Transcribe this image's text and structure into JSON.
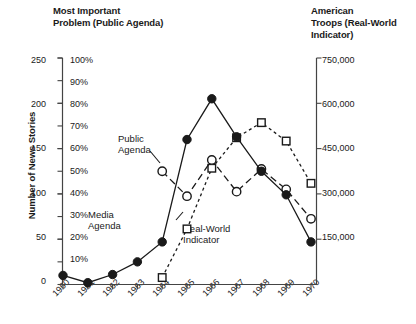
{
  "titles": {
    "left_line1": "Most Important",
    "left_line2": "Problem (Public Agenda)",
    "right_line1": "American",
    "right_line2": "Troops (Real-World",
    "right_line3": "Indicator)"
  },
  "axis": {
    "y_left_title": "Number of News Stories",
    "y_left_num_ticks": [
      "250",
      "200",
      "150",
      "100",
      "50",
      "0"
    ],
    "y_left_pct_ticks": [
      "100%",
      "90%",
      "80%",
      "70%",
      "60%",
      "50%",
      "40%",
      "30%",
      "20%",
      "10%"
    ],
    "y_right_ticks": [
      "750,000",
      "600,000",
      "450,000",
      "300,000",
      "150,000"
    ],
    "x_ticks": [
      "1960",
      "1961",
      "1962",
      "1963",
      "1964",
      "1965",
      "1966",
      "1967",
      "1968",
      "1969",
      "1970"
    ]
  },
  "annotations": {
    "public_line1": "Public",
    "public_line2": "Agenda",
    "media_line1": "Media",
    "media_line2": "Agenda",
    "real_line1": "Real-World",
    "real_line2": "Indicator"
  },
  "colors": {
    "ink": "#1a1a1a",
    "axis": "#444444",
    "background": "#ffffff"
  },
  "chart_data": {
    "type": "line",
    "xlabel": "",
    "ylabel": "Number of News Stories",
    "x": [
      1960,
      1961,
      1962,
      1963,
      1964,
      1965,
      1966,
      1967,
      1968,
      1969,
      1970
    ],
    "grid": false,
    "legend": "inline-annotations",
    "axes": [
      {
        "id": "left-stories",
        "label": "Number of News Stories",
        "ticks": [
          0,
          50,
          100,
          150,
          200,
          250
        ],
        "ylim": [
          0,
          250
        ]
      },
      {
        "id": "left-percent",
        "label": "Most Important Problem (Public Agenda)",
        "ticks": [
          10,
          20,
          30,
          40,
          50,
          60,
          70,
          80,
          90,
          100
        ],
        "ylim": [
          0,
          100
        ],
        "unit": "%"
      },
      {
        "id": "right-troops",
        "label": "American Troops (Real-World Indicator)",
        "ticks": [
          150000,
          300000,
          450000,
          600000,
          750000
        ],
        "ylim": [
          0,
          750000
        ]
      }
    ],
    "series": [
      {
        "name": "Media Agenda",
        "axis": "left-stories",
        "marker": "filled-circle",
        "line": "solid",
        "x": [
          1960,
          1961,
          1962,
          1963,
          1964,
          1965,
          1966,
          1967,
          1968,
          1969,
          1970
        ],
        "values": [
          10,
          2,
          11,
          25,
          47,
          160,
          205,
          163,
          125,
          99,
          47
        ]
      },
      {
        "name": "Public Agenda",
        "axis": "left-percent",
        "marker": "open-circle",
        "line": "dashed",
        "x": [
          1964,
          1965,
          1966,
          1967,
          1968,
          1969,
          1970
        ],
        "values": [
          50,
          39,
          55,
          41,
          51,
          42,
          29
        ]
      },
      {
        "name": "Real-World Indicator",
        "axis": "right-troops",
        "marker": "open-square",
        "line": "dotted",
        "x": [
          1964,
          1965,
          1966,
          1967,
          1968,
          1969,
          1970
        ],
        "values": [
          23000,
          184000,
          385000,
          486000,
          536000,
          475000,
          335000
        ]
      }
    ]
  }
}
